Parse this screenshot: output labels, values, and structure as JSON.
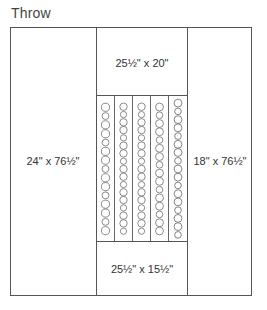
{
  "title": "Throw",
  "panels": {
    "left": {
      "label": "24\" x 76½\""
    },
    "right": {
      "label": "18\" x 76½\""
    },
    "top_center": {
      "label": "25½\" x 20\""
    },
    "bottom_center": {
      "label": "25½\" x 15½\""
    }
  },
  "center_strips": {
    "count": 5,
    "motif": "circles",
    "circles_per_strip": [
      15,
      17,
      17,
      16,
      17
    ]
  },
  "colors": {
    "line": "#555555",
    "background": "#ffffff",
    "text": "#333333"
  }
}
